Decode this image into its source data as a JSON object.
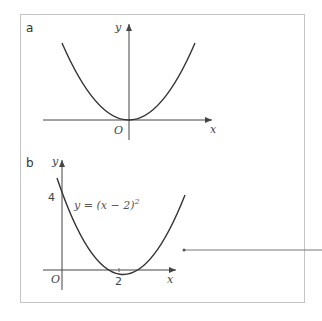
{
  "panel_a": {
    "label": "a",
    "x_axis_label": "x",
    "y_axis_label": "y",
    "origin_label": "O",
    "curve": "y = x^2"
  },
  "panel_b": {
    "label": "b",
    "x_axis_label": "x",
    "y_axis_label": "y",
    "origin_label": "O",
    "y_intercept_label": "4",
    "vertex_x_label": "2",
    "equation_main": "y = (x − 2)",
    "equation_exp": "2"
  },
  "colors": {
    "border": "#bbbbbb",
    "curve": "#333333",
    "axis": "#444444"
  }
}
